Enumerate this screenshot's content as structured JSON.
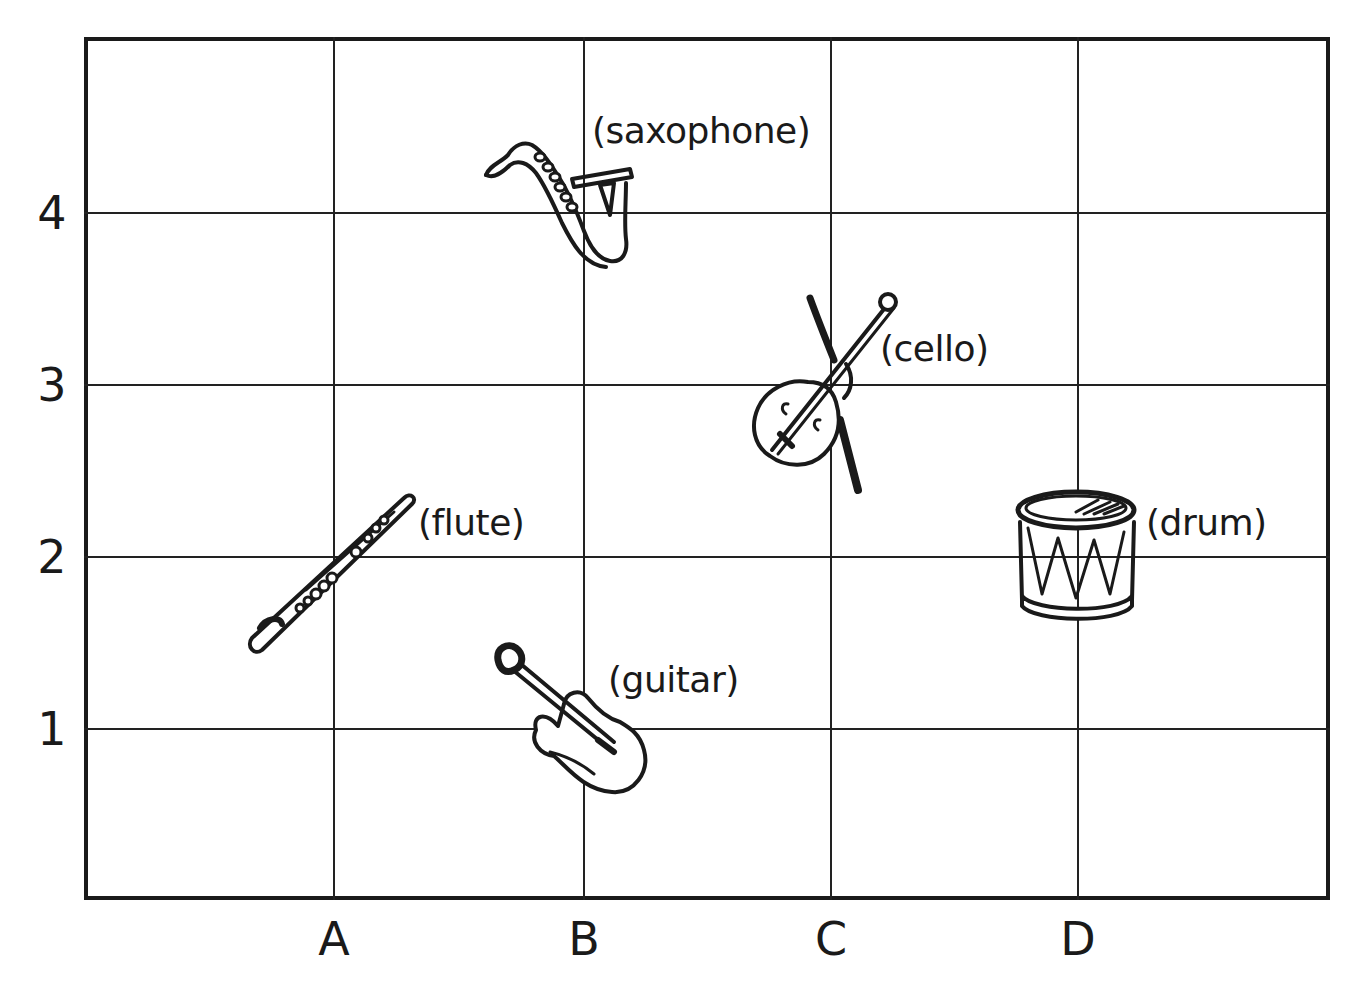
{
  "grid": {
    "columns": [
      "A",
      "B",
      "C",
      "D"
    ],
    "rows": [
      "4",
      "3",
      "2",
      "1"
    ]
  },
  "instruments": [
    {
      "name": "saxophone",
      "label": "(saxophone)",
      "column": "B",
      "row": "4",
      "icon": "saxophone-icon"
    },
    {
      "name": "cello",
      "label": "(cello)",
      "column": "C",
      "row": "3",
      "icon": "cello-icon"
    },
    {
      "name": "flute",
      "label": "(flute)",
      "column": "A",
      "row": "2",
      "icon": "flute-icon"
    },
    {
      "name": "drum",
      "label": "(drum)",
      "column": "D",
      "row": "2",
      "icon": "drum-icon"
    },
    {
      "name": "guitar",
      "label": "(guitar)",
      "column": "B",
      "row": "1",
      "icon": "guitar-icon"
    }
  ],
  "colors": {
    "line": "#1a1a1a",
    "background": "#ffffff"
  }
}
